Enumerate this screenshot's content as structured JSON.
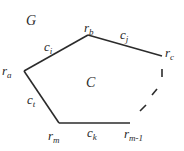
{
  "diagram": {
    "graph_label": "G",
    "cycle_label": "C",
    "colors": {
      "edge": "#2b2b2b",
      "text": "#2a2a2a",
      "background": "#ffffff"
    },
    "vertices": [
      {
        "id": "ra",
        "base": "r",
        "sub": "a",
        "x": 24,
        "y": 71
      },
      {
        "id": "rb",
        "base": "r",
        "sub": "b",
        "x": 88,
        "y": 35
      },
      {
        "id": "rc",
        "base": "r",
        "sub": "c",
        "x": 162,
        "y": 56
      },
      {
        "id": "rm1",
        "base": "r",
        "sub": "m-1",
        "x": 130,
        "y": 123
      },
      {
        "id": "rm",
        "base": "r",
        "sub": "m",
        "x": 59,
        "y": 123
      }
    ],
    "edges": [
      {
        "id": "ci",
        "base": "c",
        "sub": "i",
        "from": "ra",
        "to": "rb",
        "style": "solid"
      },
      {
        "id": "cj",
        "base": "c",
        "sub": "j",
        "from": "rb",
        "to": "rc",
        "style": "solid"
      },
      {
        "id": "ck",
        "base": "c",
        "sub": "k",
        "from": "rm",
        "to": "rm1",
        "style": "solid"
      },
      {
        "id": "ct",
        "base": "c",
        "sub": "t",
        "from": "ra",
        "to": "rm",
        "style": "solid"
      },
      {
        "id": "path-rc-rm1",
        "from": "rc",
        "to": "rm1",
        "style": "dashed"
      }
    ]
  }
}
